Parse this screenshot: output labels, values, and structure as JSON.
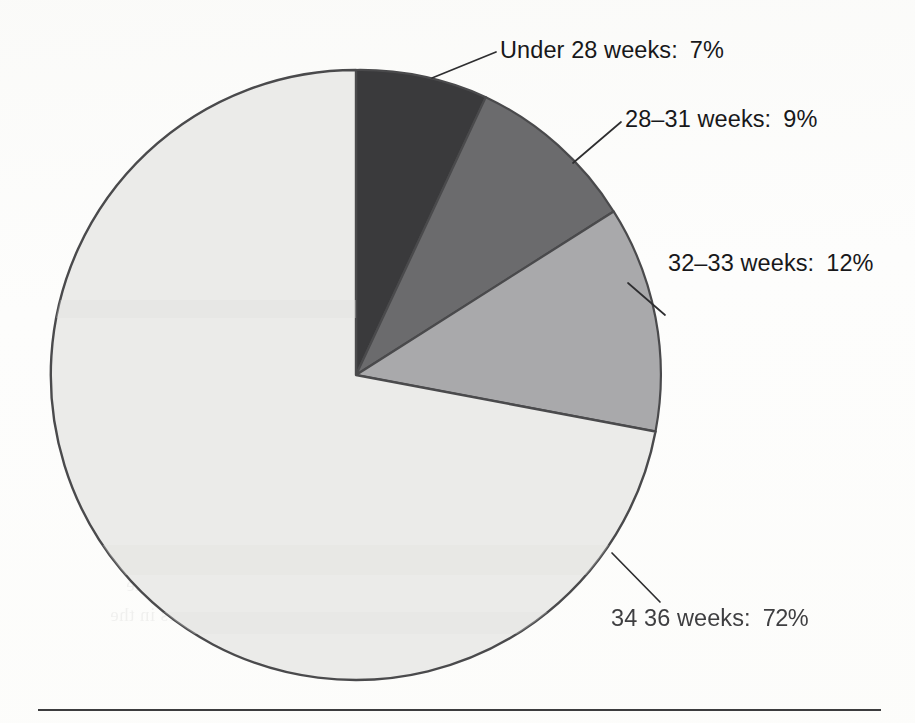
{
  "chart_data": {
    "type": "pie",
    "title": "",
    "subtitle": "",
    "xlabel": "",
    "ylabel": "",
    "legend_position": "callout-labels-right",
    "grid": false,
    "start_angle_deg": 0,
    "direction": "clockwise",
    "units": "percent",
    "categories": [
      "Under 28 weeks",
      "28–31 weeks",
      "32–33 weeks",
      "34–36 weeks"
    ],
    "values": [
      7,
      9,
      12,
      72
    ],
    "value_labels": [
      "7%",
      "9%",
      "12%",
      "72%"
    ],
    "colors": [
      "#3a3a3c",
      "#6b6b6d",
      "#a9a9ab",
      "#ebebe9"
    ],
    "slices": [
      {
        "name": "Under 28 weeks",
        "value": 7,
        "value_label": "7%",
        "label": "Under 28 weeks:",
        "color": "#3a3a3c",
        "start_pct": 0,
        "end_pct": 7
      },
      {
        "name": "28–31 weeks",
        "value": 9,
        "value_label": "9%",
        "label": "28–31 weeks:",
        "color": "#6b6b6d",
        "start_pct": 7,
        "end_pct": 16
      },
      {
        "name": "32–33 weeks",
        "value": 12,
        "value_label": "12%",
        "label": "32–33 weeks:",
        "color": "#a9a9ab",
        "start_pct": 16,
        "end_pct": 28
      },
      {
        "name": "34–36 weeks",
        "value": 72,
        "value_label": "72%",
        "label": "34–36 weeks:",
        "color": "#ebebe9",
        "start_pct": 28,
        "end_pct": 100,
        "scan_degraded": true
      }
    ]
  },
  "labels": {
    "slice_1": {
      "name": "Under 28 weeks:",
      "pct": "7%"
    },
    "slice_2": {
      "name": "28–31 weeks:",
      "pct": "9%"
    },
    "slice_3": {
      "name": "32–33 weeks:",
      "pct": "12%"
    },
    "slice_4": {
      "name": "34 36 weeks:",
      "pct": "72%"
    }
  },
  "bleed_through": {
    "lines": [
      "relates, 1970–1974,",
      "nary Services Center",
      "tion, (1970).",
      "he systems by occupa-",
      "he result, as well, of",
      "the work. The effort for",
      "that has not worsened",
      "d freight directors. At minimum",
      "compared to the condition",
      "et, is valid. As given in our reliable",
      "ation that these workers plan those",
      "ted. Our data also reveals the same",
      "ved through increases in the"
    ]
  },
  "appearance": {
    "pie_outline_color": "#4a4a4c",
    "leader_line_color": "#2e2e30",
    "label_text_color": "#18181a",
    "footer_rule_color": "#3c3c3e",
    "background_color": "#fdfdfc"
  }
}
